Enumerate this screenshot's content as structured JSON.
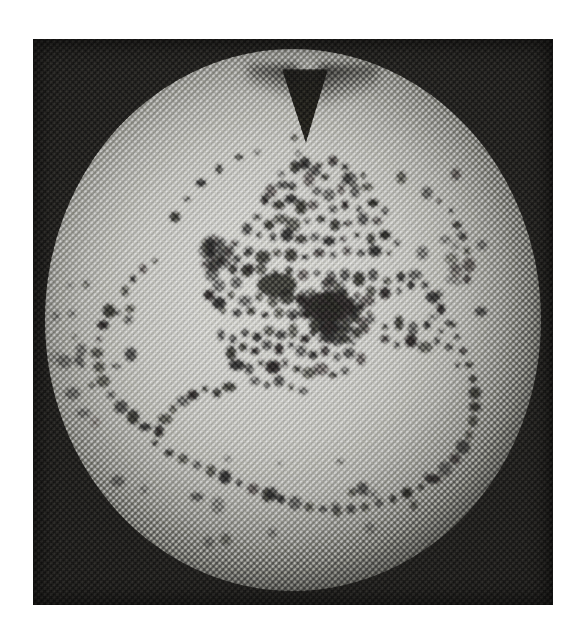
{
  "figure": {
    "kind": "halftone-printed-photograph",
    "medium_note": "scanned halftone print, ~3px dot pitch, 45-degree screen",
    "plate": {
      "x": 33,
      "y": 39,
      "width": 520,
      "height": 566
    },
    "background_color": "#ffffff",
    "plate_ink_color": "#201f1d",
    "disc_light_color": "#dcdcd8",
    "disc_edge_color": "#2e2d2b",
    "defect_color": "#2a2927"
  },
  "chart_data": {
    "type": "scatter",
    "title": "",
    "subtitle": "",
    "xlabel": "",
    "ylabel": "",
    "grid": false,
    "legend": null,
    "axis_note": "no axes, tick labels or legend are printed on the figure",
    "disc": {
      "center_x": 260,
      "center_y": 281,
      "radius_x": 248,
      "radius_y": 271,
      "notch_angle_deg": 90,
      "notch_depth": 74,
      "notch_width": 46
    },
    "clusters": [
      {
        "name": "central-dense-core",
        "cx": 296,
        "cy": 268,
        "rx": 44,
        "ry": 26,
        "weight": 1.0
      },
      {
        "name": "inner-left-ring",
        "cx": 196,
        "cy": 222,
        "rx": 26,
        "ry": 30,
        "weight": 0.85
      },
      {
        "name": "mid-left-arc",
        "cx": 60,
        "cy": 300,
        "rx": 42,
        "ry": 92,
        "weight": 0.8
      },
      {
        "name": "bottom-arc",
        "cx": 250,
        "cy": 460,
        "rx": 190,
        "ry": 50,
        "weight": 0.75
      },
      {
        "name": "right-arc",
        "cx": 420,
        "cy": 250,
        "rx": 34,
        "ry": 120,
        "weight": 0.7
      },
      {
        "name": "upper-scatter",
        "cx": 280,
        "cy": 140,
        "rx": 90,
        "ry": 50,
        "weight": 0.6
      }
    ],
    "points": [
      [
        262,
        128
      ],
      [
        272,
        124
      ],
      [
        286,
        126
      ],
      [
        300,
        122
      ],
      [
        312,
        128
      ],
      [
        292,
        138
      ],
      [
        276,
        140
      ],
      [
        318,
        140
      ],
      [
        330,
        136
      ],
      [
        334,
        148
      ],
      [
        322,
        152
      ],
      [
        308,
        150
      ],
      [
        296,
        156
      ],
      [
        284,
        152
      ],
      [
        250,
        146
      ],
      [
        238,
        152
      ],
      [
        232,
        162
      ],
      [
        246,
        166
      ],
      [
        258,
        160
      ],
      [
        268,
        168
      ],
      [
        280,
        166
      ],
      [
        300,
        170
      ],
      [
        312,
        166
      ],
      [
        326,
        170
      ],
      [
        340,
        164
      ],
      [
        352,
        172
      ],
      [
        344,
        182
      ],
      [
        330,
        180
      ],
      [
        316,
        184
      ],
      [
        302,
        186
      ],
      [
        288,
        180
      ],
      [
        274,
        182
      ],
      [
        260,
        186
      ],
      [
        248,
        180
      ],
      [
        236,
        186
      ],
      [
        224,
        178
      ],
      [
        214,
        190
      ],
      [
        226,
        196
      ],
      [
        240,
        198
      ],
      [
        254,
        196
      ],
      [
        268,
        200
      ],
      [
        282,
        198
      ],
      [
        296,
        202
      ],
      [
        310,
        200
      ],
      [
        324,
        196
      ],
      [
        338,
        200
      ],
      [
        352,
        196
      ],
      [
        364,
        204
      ],
      [
        356,
        214
      ],
      [
        342,
        212
      ],
      [
        328,
        214
      ],
      [
        314,
        212
      ],
      [
        300,
        216
      ],
      [
        286,
        214
      ],
      [
        272,
        218
      ],
      [
        258,
        216
      ],
      [
        244,
        214
      ],
      [
        230,
        218
      ],
      [
        216,
        212
      ],
      [
        204,
        220
      ],
      [
        196,
        212
      ],
      [
        188,
        222
      ],
      [
        200,
        230
      ],
      [
        214,
        232
      ],
      [
        228,
        230
      ],
      [
        242,
        234
      ],
      [
        256,
        232
      ],
      [
        270,
        236
      ],
      [
        284,
        234
      ],
      [
        298,
        238
      ],
      [
        312,
        236
      ],
      [
        326,
        240
      ],
      [
        340,
        236
      ],
      [
        354,
        242
      ],
      [
        368,
        238
      ],
      [
        378,
        246
      ],
      [
        366,
        252
      ],
      [
        352,
        254
      ],
      [
        338,
        252
      ],
      [
        324,
        256
      ],
      [
        310,
        254
      ],
      [
        296,
        258
      ],
      [
        282,
        256
      ],
      [
        268,
        260
      ],
      [
        254,
        258
      ],
      [
        240,
        262
      ],
      [
        226,
        258
      ],
      [
        212,
        262
      ],
      [
        198,
        256
      ],
      [
        186,
        264
      ],
      [
        176,
        256
      ],
      [
        190,
        272
      ],
      [
        204,
        274
      ],
      [
        218,
        272
      ],
      [
        232,
        276
      ],
      [
        246,
        274
      ],
      [
        260,
        278
      ],
      [
        274,
        276
      ],
      [
        288,
        266
      ],
      [
        296,
        264
      ],
      [
        304,
        268
      ],
      [
        312,
        266
      ],
      [
        320,
        272
      ],
      [
        328,
        268
      ],
      [
        336,
        274
      ],
      [
        290,
        276
      ],
      [
        298,
        280
      ],
      [
        306,
        278
      ],
      [
        314,
        282
      ],
      [
        322,
        280
      ],
      [
        330,
        284
      ],
      [
        338,
        280
      ],
      [
        284,
        286
      ],
      [
        292,
        290
      ],
      [
        300,
        288
      ],
      [
        308,
        292
      ],
      [
        316,
        290
      ],
      [
        324,
        294
      ],
      [
        332,
        290
      ],
      [
        296,
        298
      ],
      [
        304,
        302
      ],
      [
        312,
        300
      ],
      [
        320,
        304
      ],
      [
        288,
        300
      ],
      [
        280,
        294
      ],
      [
        272,
        300
      ],
      [
        260,
        292
      ],
      [
        248,
        296
      ],
      [
        236,
        292
      ],
      [
        224,
        298
      ],
      [
        212,
        294
      ],
      [
        200,
        300
      ],
      [
        188,
        296
      ],
      [
        352,
        288
      ],
      [
        366,
        284
      ],
      [
        380,
        290
      ],
      [
        394,
        286
      ],
      [
        408,
        292
      ],
      [
        420,
        286
      ],
      [
        352,
        300
      ],
      [
        364,
        306
      ],
      [
        378,
        302
      ],
      [
        392,
        308
      ],
      [
        404,
        302
      ],
      [
        416,
        308
      ],
      [
        258,
        306
      ],
      [
        246,
        310
      ],
      [
        234,
        306
      ],
      [
        222,
        312
      ],
      [
        210,
        308
      ],
      [
        198,
        314
      ],
      [
        268,
        312
      ],
      [
        280,
        316
      ],
      [
        292,
        312
      ],
      [
        304,
        318
      ],
      [
        316,
        314
      ],
      [
        328,
        320
      ],
      [
        252,
        324
      ],
      [
        240,
        328
      ],
      [
        228,
        324
      ],
      [
        216,
        330
      ],
      [
        204,
        326
      ],
      [
        264,
        330
      ],
      [
        276,
        334
      ],
      [
        288,
        330
      ],
      [
        300,
        336
      ],
      [
        312,
        332
      ],
      [
        246,
        342
      ],
      [
        234,
        346
      ],
      [
        222,
        342
      ],
      [
        258,
        348
      ],
      [
        270,
        352
      ],
      [
        196,
        348
      ],
      [
        184,
        354
      ],
      [
        172,
        350
      ],
      [
        160,
        356
      ],
      [
        150,
        362
      ],
      [
        140,
        370
      ],
      [
        132,
        380
      ],
      [
        126,
        392
      ],
      [
        122,
        404
      ],
      [
        136,
        414
      ],
      [
        150,
        420
      ],
      [
        164,
        426
      ],
      [
        178,
        432
      ],
      [
        192,
        438
      ],
      [
        206,
        444
      ],
      [
        220,
        450
      ],
      [
        234,
        456
      ],
      [
        248,
        460
      ],
      [
        262,
        464
      ],
      [
        276,
        468
      ],
      [
        290,
        470
      ],
      [
        304,
        472
      ],
      [
        318,
        470
      ],
      [
        332,
        468
      ],
      [
        346,
        464
      ],
      [
        360,
        460
      ],
      [
        374,
        454
      ],
      [
        388,
        448
      ],
      [
        400,
        440
      ],
      [
        412,
        430
      ],
      [
        422,
        420
      ],
      [
        430,
        408
      ],
      [
        436,
        396
      ],
      [
        440,
        382
      ],
      [
        442,
        368
      ],
      [
        442,
        354
      ],
      [
        440,
        340
      ],
      [
        436,
        326
      ],
      [
        430,
        312
      ],
      [
        424,
        298
      ],
      [
        416,
        284
      ],
      [
        408,
        270
      ],
      [
        400,
        258
      ],
      [
        392,
        246
      ],
      [
        382,
        236
      ],
      [
        76,
        272
      ],
      [
        70,
        286
      ],
      [
        66,
        300
      ],
      [
        64,
        314
      ],
      [
        66,
        328
      ],
      [
        70,
        342
      ],
      [
        78,
        356
      ],
      [
        88,
        368
      ],
      [
        100,
        378
      ],
      [
        112,
        388
      ],
      [
        124,
        396
      ],
      [
        92,
        252
      ],
      [
        100,
        240
      ],
      [
        110,
        230
      ],
      [
        122,
        222
      ],
      [
        424,
        186
      ],
      [
        430,
        198
      ],
      [
        434,
        212
      ],
      [
        436,
        226
      ],
      [
        434,
        240
      ],
      [
        418,
        172
      ],
      [
        406,
        162
      ],
      [
        394,
        154
      ],
      [
        206,
        118
      ],
      [
        186,
        130
      ],
      [
        168,
        144
      ],
      [
        154,
        160
      ],
      [
        142,
        178
      ]
    ],
    "point_count": 248,
    "value_range": [
      0,
      1
    ]
  }
}
